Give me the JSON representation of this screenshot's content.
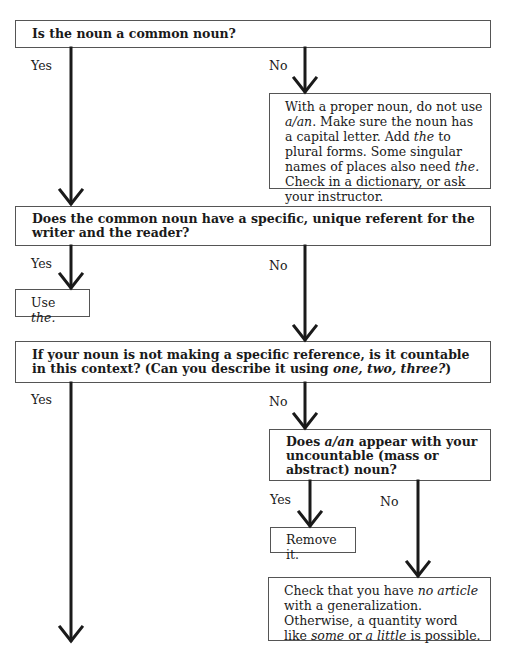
{
  "nodes": {
    "q1": {
      "text": "Is the noun a common noun?"
    },
    "q1_yes": "Yes",
    "q1_no": "No",
    "proper_noun": {
      "parts": [
        "With a proper noun, do not use ",
        "a/an",
        ". Make sure the noun has a capital letter. Add ",
        "the",
        " to plural forms. Some singular names of places also need ",
        "the.",
        " Check in a dictionary, or ask your instructor."
      ]
    },
    "q2": {
      "text": "Does the common noun have a specific, unique referent for the writer and the reader?"
    },
    "q2_yes": "Yes",
    "q2_no": "No",
    "use_the": {
      "prefix": "Use ",
      "italic": "the."
    },
    "q3": {
      "text": "If your noun is not making a specific reference, is it countable in this context? (Can you describe it using ",
      "italic": "one, two, three?",
      "suffix": ")"
    },
    "q3_yes": "Yes",
    "q3_no": "No",
    "q4": {
      "prefix": "Does ",
      "italic": "a/an",
      "suffix": " appear with your uncountable (mass or abstract) noun?"
    },
    "q4_yes": "Yes",
    "q4_no": "No",
    "remove_it": "Remove it.",
    "no_article": {
      "parts": [
        "Check that you have ",
        "no article",
        " with a generalization. Otherwise, a quantity word like ",
        "some",
        " or ",
        "a little",
        " is possible."
      ]
    }
  },
  "colors": {
    "line": "#1a1a1a",
    "box_border": "#555555",
    "background": "#ffffff"
  }
}
